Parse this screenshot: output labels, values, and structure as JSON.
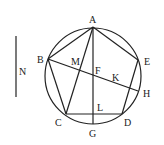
{
  "diagram": {
    "type": "geometric-construction",
    "colors": {
      "ink": "#222222",
      "background": "#ffffff"
    },
    "circle": {
      "cx": 93,
      "cy": 76,
      "r": 48
    },
    "points": {
      "A": {
        "x": 93,
        "y": 27
      },
      "B": {
        "x": 48,
        "y": 59
      },
      "C": {
        "x": 66,
        "y": 114
      },
      "D": {
        "x": 122,
        "y": 114
      },
      "E": {
        "x": 138,
        "y": 60
      },
      "G": {
        "x": 93,
        "y": 124
      },
      "H": {
        "x": 138,
        "y": 91
      },
      "F": {
        "x": 93,
        "y": 76
      },
      "M": {
        "x": 79,
        "y": 69
      },
      "K": {
        "x": 116,
        "y": 84
      },
      "L": {
        "x": 93,
        "y": 114
      }
    },
    "segments": [
      [
        "A",
        "B"
      ],
      [
        "A",
        "C"
      ],
      [
        "A",
        "E"
      ],
      [
        "A",
        "G"
      ],
      [
        "B",
        "C"
      ],
      [
        "B",
        "H"
      ],
      [
        "C",
        "D"
      ],
      [
        "D",
        "E"
      ]
    ],
    "labels": {
      "A": "A",
      "B": "B",
      "C": "C",
      "D": "D",
      "E": "E",
      "F": "F",
      "G": "G",
      "H": "H",
      "K": "K",
      "L": "L",
      "M": "M",
      "N": "N"
    },
    "auxiliary_line": {
      "label": "N",
      "x": 16,
      "y1": 36,
      "y2": 97
    }
  }
}
